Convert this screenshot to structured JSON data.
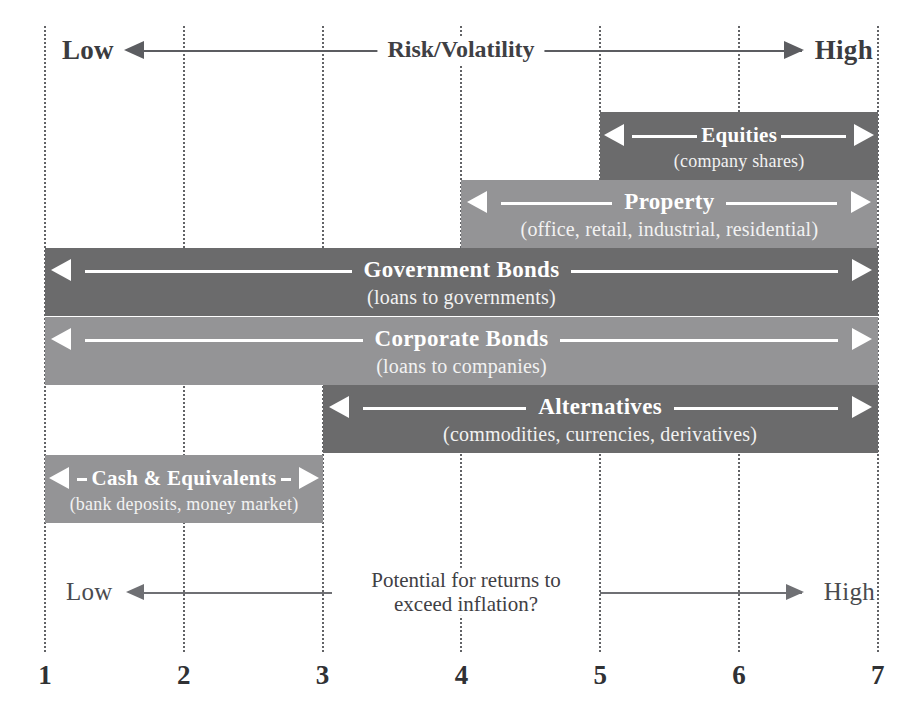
{
  "figure": {
    "bar_color_dark": "#6b6b6c",
    "bar_color_light": "#949496",
    "gridline_color": "#55565a",
    "text_color": "#3b3c40"
  },
  "top_axis": {
    "low_label": "Low",
    "caption": "Risk/Volatility",
    "high_label": "High"
  },
  "bottom_axis": {
    "low_label": "Low",
    "caption_line1": "Potential for returns to",
    "caption_line2": "exceed inflation?",
    "high_label": "High"
  },
  "scale": {
    "ticks": [
      "1",
      "2",
      "3",
      "4",
      "5",
      "6",
      "7"
    ]
  },
  "chart_data": {
    "type": "bar",
    "xlabel": "Risk/Volatility",
    "ylabel": "",
    "xlim": [
      1,
      7
    ],
    "grid": true,
    "legend": "none",
    "tick_labels": [
      "1",
      "2",
      "3",
      "4",
      "5",
      "6",
      "7"
    ],
    "axis_top_label_low": "Low",
    "axis_top_label_high": "High",
    "axis_top_caption": "Risk/Volatility",
    "axis_bottom_label_low": "Low",
    "axis_bottom_label_high": "High",
    "axis_bottom_caption": "Potential for returns to exceed inflation?",
    "bars": [
      {
        "name": "Equities",
        "subtitle": "(company shares)",
        "start": 5,
        "end": 7,
        "row": 0,
        "shade": "dark",
        "color": "#6b6b6c"
      },
      {
        "name": "Property",
        "subtitle": "(office, retail, industrial, residential)",
        "start": 4,
        "end": 7,
        "row": 1,
        "shade": "light",
        "color": "#949496"
      },
      {
        "name": "Government Bonds",
        "subtitle": "(loans to governments)",
        "start": 1,
        "end": 7,
        "row": 2,
        "shade": "dark",
        "color": "#6b6b6c"
      },
      {
        "name": "Corporate Bonds",
        "subtitle": "(loans to companies)",
        "start": 1,
        "end": 7,
        "row": 3,
        "shade": "light",
        "color": "#949496"
      },
      {
        "name": "Alternatives",
        "subtitle": "(commodities, currencies, derivatives)",
        "start": 3,
        "end": 7,
        "row": 4,
        "shade": "dark",
        "color": "#6b6b6c"
      },
      {
        "name": "Cash & Equivalents",
        "subtitle": "(bank deposits, money market)",
        "start": 1,
        "end": 3,
        "row": 5,
        "shade": "light",
        "color": "#949496"
      }
    ]
  }
}
